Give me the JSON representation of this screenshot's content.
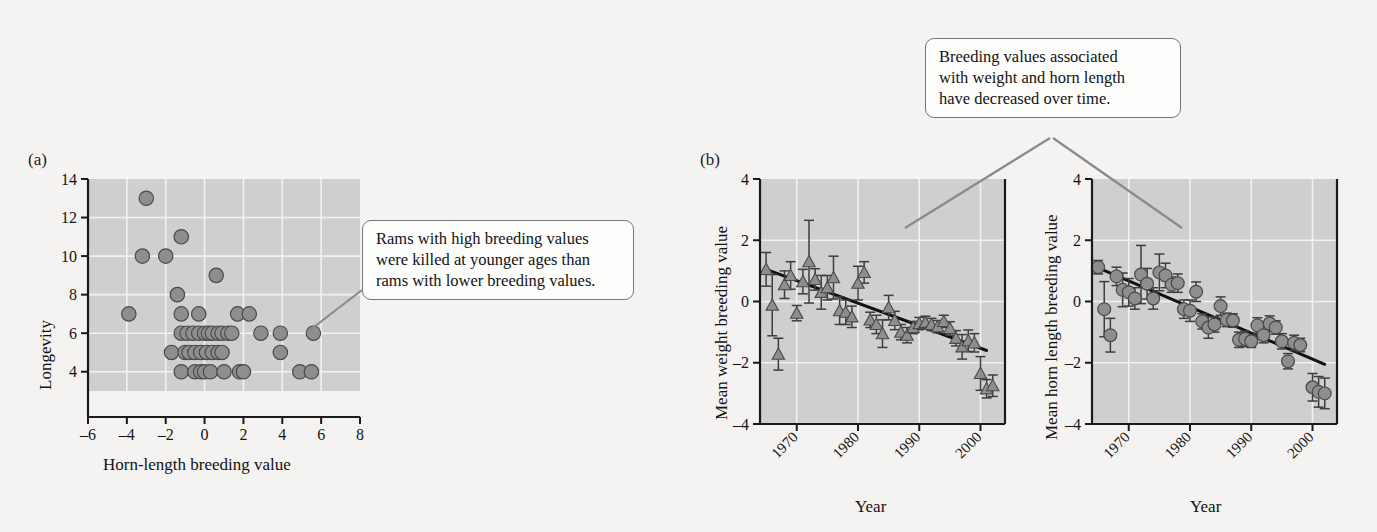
{
  "figure": {
    "panel_a_label": "(a)",
    "panel_b_label": "(b)"
  },
  "callouts": {
    "a": {
      "name": "callout-longevity",
      "lines": [
        "Rams with high breeding values",
        "were killed at younger ages than",
        "rams with lower breeding values."
      ]
    },
    "b": {
      "name": "callout-trend",
      "lines": [
        "Breeding values associated",
        "with weight and horn length",
        "have decreased over time."
      ]
    }
  },
  "colors": {
    "plot_background": "#cfcfcf",
    "gridline": "#f2f2f2",
    "marker_fill": "#8e8e8e",
    "marker_stroke": "#4a4a4a",
    "axis": "#1a1a1a",
    "trendline": "#111111",
    "errorbar": "#3d3d3d",
    "callout_border": "#767676",
    "leader_line": "#8a8a8a",
    "page_background": "#f4f3f1"
  },
  "chart_data": [
    {
      "name": "longevity-vs-horn-length",
      "type": "scatter",
      "title": "",
      "xlabel": "Horn-length breeding value",
      "ylabel": "Longevity",
      "xlim": [
        -6,
        8
      ],
      "ylim": [
        3,
        14
      ],
      "xticks": [
        -6,
        -4,
        -2,
        0,
        2,
        4,
        6,
        8
      ],
      "xtick_labels": [
        "–6",
        "–4",
        "–2",
        "0",
        "2",
        "4",
        "6",
        "8"
      ],
      "yticks": [
        4,
        6,
        8,
        10,
        12,
        14
      ],
      "ytick_labels": [
        "4",
        "6",
        "8",
        "10",
        "12",
        "14"
      ],
      "grid": true,
      "marker": "circle",
      "points": [
        [
          -3.0,
          13
        ],
        [
          -1.2,
          11
        ],
        [
          -3.2,
          10
        ],
        [
          -2.0,
          10
        ],
        [
          0.6,
          9
        ],
        [
          -1.4,
          8
        ],
        [
          -3.9,
          7
        ],
        [
          -1.2,
          7
        ],
        [
          -0.3,
          7
        ],
        [
          1.7,
          7
        ],
        [
          2.3,
          7
        ],
        [
          -1.2,
          6
        ],
        [
          -0.9,
          6
        ],
        [
          -0.6,
          6
        ],
        [
          -0.3,
          6
        ],
        [
          0.0,
          6
        ],
        [
          0.2,
          6
        ],
        [
          0.4,
          6
        ],
        [
          0.7,
          6
        ],
        [
          0.9,
          6
        ],
        [
          1.2,
          6
        ],
        [
          1.4,
          6
        ],
        [
          2.9,
          6
        ],
        [
          3.9,
          6
        ],
        [
          5.6,
          6
        ],
        [
          -1.7,
          5
        ],
        [
          -1.0,
          5
        ],
        [
          -0.8,
          5
        ],
        [
          -0.5,
          5
        ],
        [
          -0.2,
          5
        ],
        [
          0.1,
          5
        ],
        [
          0.4,
          5
        ],
        [
          0.7,
          5
        ],
        [
          0.9,
          5
        ],
        [
          3.9,
          5
        ],
        [
          -1.2,
          4
        ],
        [
          -0.5,
          4
        ],
        [
          -0.2,
          4
        ],
        [
          0.0,
          4
        ],
        [
          0.3,
          4
        ],
        [
          1.0,
          4
        ],
        [
          1.8,
          4
        ],
        [
          2.0,
          4
        ],
        [
          4.9,
          4
        ],
        [
          5.5,
          4
        ]
      ]
    },
    {
      "name": "mean-weight-breeding-value-by-year",
      "type": "scatter",
      "title": "",
      "xlabel": "Year",
      "ylabel": "Mean weight breeding value",
      "xlim": [
        1964,
        2004
      ],
      "ylim": [
        -4,
        4
      ],
      "xticks": [
        1970,
        1980,
        1990,
        2000
      ],
      "xtick_labels": [
        "1970",
        "1980",
        "1990",
        "2000"
      ],
      "yticks": [
        -4,
        -2,
        0,
        2,
        4
      ],
      "ytick_labels": [
        "–4",
        "–2",
        "0",
        "2",
        "4"
      ],
      "grid": true,
      "marker": "triangle",
      "error_bars": true,
      "trendline": {
        "x1": 1965,
        "y1": 1.05,
        "x2": 2001,
        "y2": -1.6
      },
      "points": [
        {
          "x": 1965,
          "y": 1.05,
          "err": 0.55
        },
        {
          "x": 1966,
          "y": -0.12,
          "err": 1.0
        },
        {
          "x": 1967,
          "y": -1.72,
          "err": 0.52
        },
        {
          "x": 1968,
          "y": 0.55,
          "err": 0.45
        },
        {
          "x": 1969,
          "y": 0.85,
          "err": 0.45
        },
        {
          "x": 1970,
          "y": -0.38,
          "err": 0.25
        },
        {
          "x": 1971,
          "y": 0.65,
          "err": 0.4
        },
        {
          "x": 1972,
          "y": 1.3,
          "err": 1.35
        },
        {
          "x": 1973,
          "y": 0.72,
          "err": 0.35
        },
        {
          "x": 1974,
          "y": 0.3,
          "err": 0.55
        },
        {
          "x": 1975,
          "y": 0.45,
          "err": 0.4
        },
        {
          "x": 1976,
          "y": 0.78,
          "err": 0.7
        },
        {
          "x": 1977,
          "y": -0.3,
          "err": 0.45
        },
        {
          "x": 1978,
          "y": -0.35,
          "err": 0.4
        },
        {
          "x": 1979,
          "y": -0.5,
          "err": 0.35
        },
        {
          "x": 1980,
          "y": 0.6,
          "err": 0.55
        },
        {
          "x": 1981,
          "y": 0.95,
          "err": 0.35
        },
        {
          "x": 1982,
          "y": -0.6,
          "err": 0.25
        },
        {
          "x": 1983,
          "y": -0.75,
          "err": 0.3
        },
        {
          "x": 1984,
          "y": -1.05,
          "err": 0.45
        },
        {
          "x": 1985,
          "y": -0.2,
          "err": 0.4
        },
        {
          "x": 1986,
          "y": -0.62,
          "err": 0.3
        },
        {
          "x": 1987,
          "y": -1.0,
          "err": 0.25
        },
        {
          "x": 1988,
          "y": -1.1,
          "err": 0.25
        },
        {
          "x": 1989,
          "y": -0.85,
          "err": 0.2
        },
        {
          "x": 1990,
          "y": -0.72,
          "err": 0.2
        },
        {
          "x": 1991,
          "y": -0.68,
          "err": 0.2
        },
        {
          "x": 1992,
          "y": -0.75,
          "err": 0.2
        },
        {
          "x": 1993,
          "y": -0.82,
          "err": 0.2
        },
        {
          "x": 1994,
          "y": -0.65,
          "err": 0.2
        },
        {
          "x": 1995,
          "y": -0.88,
          "err": 0.22
        },
        {
          "x": 1996,
          "y": -1.2,
          "err": 0.25
        },
        {
          "x": 1997,
          "y": -1.48,
          "err": 0.4
        },
        {
          "x": 1998,
          "y": -1.28,
          "err": 0.35
        },
        {
          "x": 1999,
          "y": -1.35,
          "err": 0.3
        },
        {
          "x": 2000,
          "y": -2.35,
          "err": 0.55
        },
        {
          "x": 2001,
          "y": -2.85,
          "err": 0.3
        },
        {
          "x": 2002,
          "y": -2.75,
          "err": 0.35
        }
      ]
    },
    {
      "name": "mean-horn-length-breeding-value-by-year",
      "type": "scatter",
      "title": "",
      "xlabel": "Year",
      "ylabel": "Mean horn length breeding value",
      "xlim": [
        1964,
        2004
      ],
      "ylim": [
        -4,
        4
      ],
      "xticks": [
        1970,
        1980,
        1990,
        2000
      ],
      "xtick_labels": [
        "1970",
        "1980",
        "1990",
        "2000"
      ],
      "yticks": [
        -4,
        -2,
        0,
        2,
        4
      ],
      "ytick_labels": [
        "–4",
        "–2",
        "0",
        "2",
        "4"
      ],
      "grid": true,
      "marker": "circle",
      "error_bars": true,
      "trendline": {
        "x1": 1965,
        "y1": 1.1,
        "x2": 2002,
        "y2": -2.05
      },
      "points": [
        {
          "x": 1965,
          "y": 1.12,
          "err": 0.22
        },
        {
          "x": 1966,
          "y": -0.25,
          "err": 0.9
        },
        {
          "x": 1967,
          "y": -1.1,
          "err": 0.55
        },
        {
          "x": 1968,
          "y": 0.82,
          "err": 0.3
        },
        {
          "x": 1969,
          "y": 0.38,
          "err": 0.55
        },
        {
          "x": 1970,
          "y": 0.3,
          "err": 0.45
        },
        {
          "x": 1971,
          "y": 0.1,
          "err": 0.35
        },
        {
          "x": 1972,
          "y": 0.88,
          "err": 0.95
        },
        {
          "x": 1973,
          "y": 0.58,
          "err": 0.5
        },
        {
          "x": 1974,
          "y": 0.1,
          "err": 0.35
        },
        {
          "x": 1975,
          "y": 0.95,
          "err": 0.6
        },
        {
          "x": 1976,
          "y": 0.85,
          "err": 0.4
        },
        {
          "x": 1977,
          "y": 0.55,
          "err": 0.25
        },
        {
          "x": 1978,
          "y": 0.6,
          "err": 0.3
        },
        {
          "x": 1979,
          "y": -0.25,
          "err": 0.3
        },
        {
          "x": 1980,
          "y": -0.3,
          "err": 0.35
        },
        {
          "x": 1981,
          "y": 0.32,
          "err": 0.32
        },
        {
          "x": 1982,
          "y": -0.65,
          "err": 0.25
        },
        {
          "x": 1983,
          "y": -0.85,
          "err": 0.35
        },
        {
          "x": 1984,
          "y": -0.75,
          "err": 0.25
        },
        {
          "x": 1985,
          "y": -0.15,
          "err": 0.3
        },
        {
          "x": 1986,
          "y": -0.6,
          "err": 0.22
        },
        {
          "x": 1987,
          "y": -0.62,
          "err": 0.22
        },
        {
          "x": 1988,
          "y": -1.25,
          "err": 0.25
        },
        {
          "x": 1989,
          "y": -1.22,
          "err": 0.25
        },
        {
          "x": 1990,
          "y": -1.3,
          "err": 0.2
        },
        {
          "x": 1991,
          "y": -0.78,
          "err": 0.25
        },
        {
          "x": 1992,
          "y": -1.1,
          "err": 0.25
        },
        {
          "x": 1993,
          "y": -0.72,
          "err": 0.25
        },
        {
          "x": 1994,
          "y": -0.85,
          "err": 0.22
        },
        {
          "x": 1995,
          "y": -1.3,
          "err": 0.25
        },
        {
          "x": 1996,
          "y": -1.95,
          "err": 0.25
        },
        {
          "x": 1997,
          "y": -1.35,
          "err": 0.25
        },
        {
          "x": 1998,
          "y": -1.42,
          "err": 0.22
        },
        {
          "x": 2000,
          "y": -2.8,
          "err": 0.45
        },
        {
          "x": 2001,
          "y": -2.95,
          "err": 0.5
        },
        {
          "x": 2002,
          "y": -3.0,
          "err": 0.5
        }
      ]
    }
  ]
}
